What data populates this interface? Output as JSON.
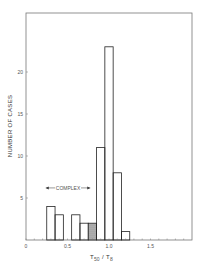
{
  "chart_data": {
    "type": "bar",
    "subtype": "histogram",
    "title": "",
    "xlabel": "T50 / T8",
    "xlabel_main": "T",
    "xlabel_sub1": "50",
    "xlabel_sub2": "8",
    "ylabel": "NUMBER OF CASES",
    "xlim": [
      0,
      1.95
    ],
    "ylim": [
      0,
      27
    ],
    "xticks": [
      0,
      0.5,
      1.0,
      1.5
    ],
    "xtick_labels": [
      "0",
      "0.5",
      "1.0",
      "1.5"
    ],
    "yticks": [
      5,
      10,
      15,
      20
    ],
    "ytick_labels": [
      "5",
      "10",
      "15",
      "20"
    ],
    "bin_width": 0.1,
    "bins": [
      {
        "start": 0.25,
        "end": 0.35,
        "count": 4,
        "hatched": false
      },
      {
        "start": 0.35,
        "end": 0.45,
        "count": 3,
        "hatched": false
      },
      {
        "start": 0.45,
        "end": 0.55,
        "count": 0,
        "hatched": false
      },
      {
        "start": 0.55,
        "end": 0.65,
        "count": 3,
        "hatched": false
      },
      {
        "start": 0.65,
        "end": 0.75,
        "count": 2,
        "hatched": false
      },
      {
        "start": 0.75,
        "end": 0.85,
        "count": 2,
        "hatched": true
      },
      {
        "start": 0.85,
        "end": 0.95,
        "count": 11,
        "hatched": false
      },
      {
        "start": 0.95,
        "end": 1.05,
        "count": 23,
        "hatched": false
      },
      {
        "start": 1.05,
        "end": 1.15,
        "count": 8,
        "hatched": false
      },
      {
        "start": 1.15,
        "end": 1.25,
        "count": 1,
        "hatched": false
      }
    ],
    "annotations": [
      {
        "text": "COMPLEX",
        "type": "range-arrow",
        "x_start": 0.25,
        "x_end": 0.75,
        "y": 6.2
      }
    ],
    "grid": false,
    "legend": null
  },
  "labels": {
    "annotation": "COMPLEX"
  }
}
